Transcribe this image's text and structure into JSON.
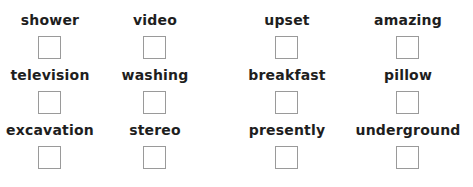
{
  "grid": {
    "rows": [
      {
        "items": [
          {
            "label": "shower",
            "checked": false
          },
          {
            "label": "video",
            "checked": false
          },
          {
            "label": "upset",
            "checked": false
          },
          {
            "label": "amazing",
            "checked": false
          }
        ]
      },
      {
        "items": [
          {
            "label": "television",
            "checked": false
          },
          {
            "label": "washing",
            "checked": false
          },
          {
            "label": "breakfast",
            "checked": false
          },
          {
            "label": "pillow",
            "checked": false
          }
        ]
      },
      {
        "items": [
          {
            "label": "excavation",
            "checked": false
          },
          {
            "label": "stereo",
            "checked": false
          },
          {
            "label": "presently",
            "checked": false
          },
          {
            "label": "underground",
            "checked": false
          }
        ]
      }
    ]
  },
  "colors": {
    "text": "#1e1e1e",
    "box_border": "#9a9a9a",
    "background": "#ffffff"
  }
}
